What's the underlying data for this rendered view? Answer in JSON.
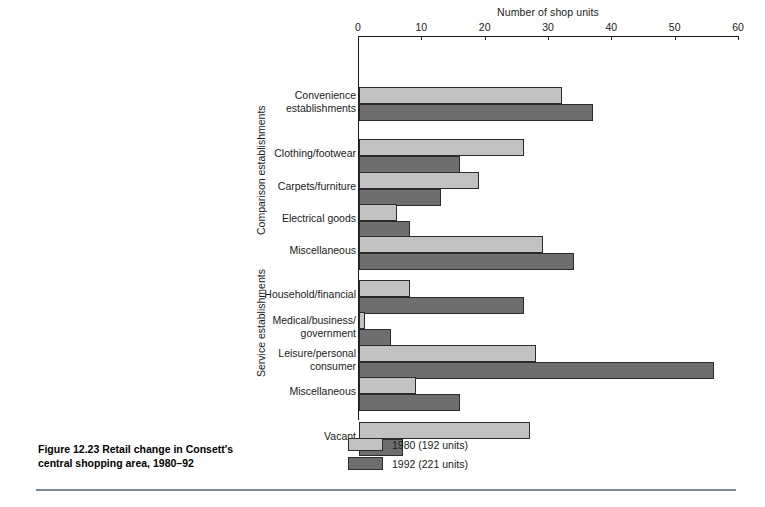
{
  "figure": {
    "caption": "Figure 12.23  Retail change in Consett's central shopping area, 1980–92"
  },
  "legend": {
    "items": [
      {
        "label": "1980 (192 units)",
        "color": "#c2c2c2",
        "series": "1980"
      },
      {
        "label": "1992 (221 units)",
        "color": "#6e6e6e",
        "series": "1992"
      }
    ]
  },
  "groups": [
    {
      "id": "comparison",
      "label": "Comparison establishments"
    },
    {
      "id": "service",
      "label": "Service establishments"
    }
  ],
  "axis": {
    "title": "Number of shop units",
    "ticks": [
      "0",
      "10",
      "20",
      "30",
      "40",
      "50",
      "60"
    ],
    "min": 0,
    "max": 60
  },
  "chart_data": {
    "type": "bar",
    "orientation": "horizontal",
    "title": "Retail change in Consett's central shopping area, 1980–92",
    "xlabel": "Number of shop units",
    "ylabel": "",
    "xlim": [
      0,
      60
    ],
    "xticks": [
      0,
      10,
      20,
      30,
      40,
      50,
      60
    ],
    "grid": false,
    "legend_position": "bottom",
    "categories": [
      "Convenience establishments",
      "Clothing/footwear",
      "Carpets/furniture",
      "Electrical goods",
      "Miscellaneous",
      "Household/financial",
      "Medical/business/government",
      "Leisure/personal consumer",
      "Miscellaneous",
      "Vacant"
    ],
    "category_groups": [
      "Convenience establishments",
      "Comparison establishments",
      "Comparison establishments",
      "Comparison establishments",
      "Comparison establishments",
      "Service establishments",
      "Service establishments",
      "Service establishments",
      "Service establishments",
      "Vacant"
    ],
    "series": [
      {
        "name": "1980 (192 units)",
        "color": "#c2c2c2",
        "values": [
          32,
          26,
          19,
          6,
          29,
          8,
          1,
          28,
          9,
          27
        ]
      },
      {
        "name": "1992 (221 units)",
        "color": "#6e6e6e",
        "values": [
          37,
          16,
          13,
          8,
          34,
          26,
          5,
          56,
          16,
          7
        ]
      }
    ]
  },
  "rows": [
    {
      "label": "Convenience\nestablishments",
      "label_top": 49,
      "v1980": 32,
      "v1992": 37,
      "y1980": 47,
      "y1992": 64
    },
    {
      "label": "Clothing/footwear",
      "label_top": 107,
      "v1980": 26,
      "v1992": 16,
      "y1980": 99,
      "y1992": 116
    },
    {
      "label": "Carpets/furniture",
      "label_top": 140,
      "v1980": 19,
      "v1992": 13,
      "y1980": 132,
      "y1992": 149
    },
    {
      "label": "Electrical goods",
      "label_top": 172,
      "v1980": 6,
      "v1992": 8,
      "y1980": 164,
      "y1992": 181
    },
    {
      "label": "Miscellaneous",
      "label_top": 204,
      "v1980": 29,
      "v1992": 34,
      "y1980": 196,
      "y1992": 213
    },
    {
      "label": "Household/financial",
      "label_top": 248,
      "v1980": 8,
      "v1992": 26,
      "y1980": 240,
      "y1992": 257
    },
    {
      "label": "Medical/business/\ngovernment",
      "label_top": 274,
      "v1980": 1,
      "v1992": 5,
      "y1980": 272,
      "y1992": 289
    },
    {
      "label": "Leisure/personal\nconsumer",
      "label_top": 307,
      "v1980": 28,
      "v1992": 56,
      "y1980": 305,
      "y1992": 322
    },
    {
      "label": "Miscellaneous",
      "label_top": 345,
      "v1980": 9,
      "v1992": 16,
      "y1980": 337,
      "y1992": 354
    },
    {
      "label": "Vacant",
      "label_top": 390,
      "v1980": 27,
      "v1992": 7,
      "y1980": 382,
      "y1992": 399
    }
  ]
}
